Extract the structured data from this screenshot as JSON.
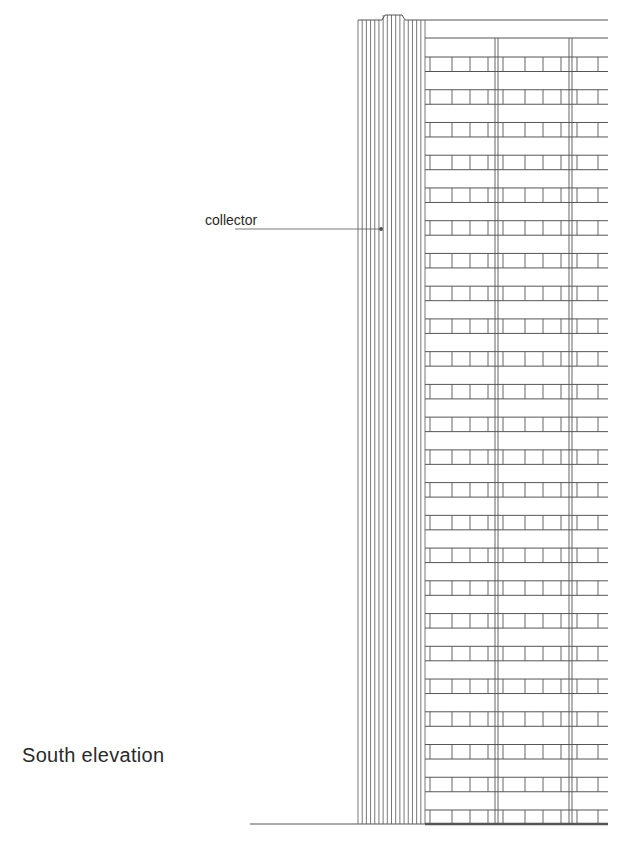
{
  "title": "South elevation",
  "annotations": {
    "collector": "collector"
  },
  "drawing": {
    "stroke_color": "#555555",
    "floors": 24,
    "collector_stripes": 16
  }
}
